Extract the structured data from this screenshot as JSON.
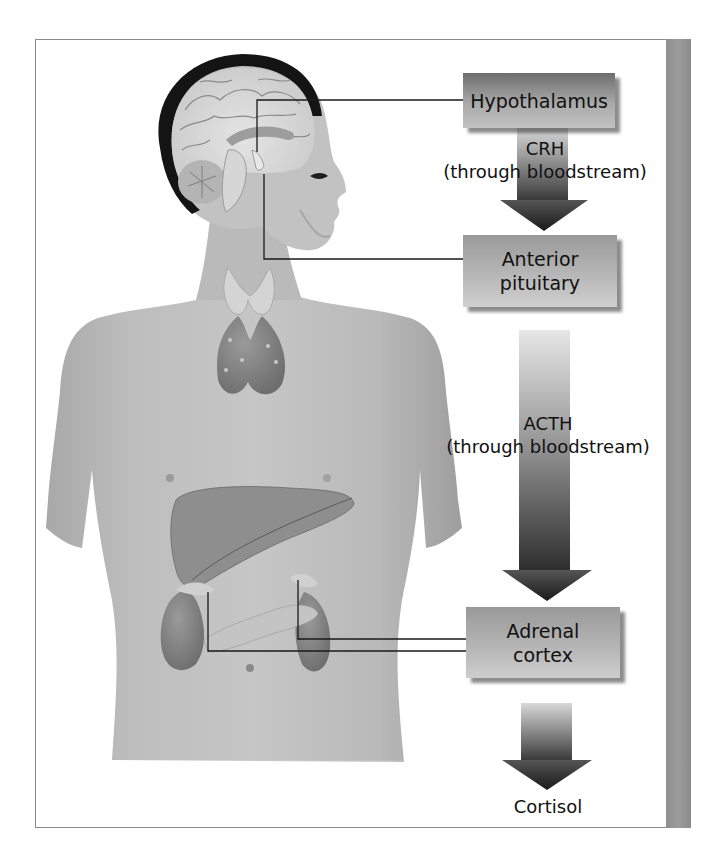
{
  "diagram": {
    "boxes": {
      "hypothalamus": "Hypothalamus",
      "anterior_pituitary_line1": "Anterior",
      "anterior_pituitary_line2": "pituitary",
      "adrenal_cortex_line1": "Adrenal",
      "adrenal_cortex_line2": "cortex"
    },
    "arrows": {
      "crh_line1": "CRH",
      "crh_line2": "(through bloodstream)",
      "acth_line1": "ACTH",
      "acth_line2": "(through bloodstream)"
    },
    "output": "Cortisol",
    "illustration": {
      "description": "Human figure with sagittal brain section, thyroid, liver, pancreas and kidneys with adrenal glands",
      "structures": [
        "brain",
        "hypothalamus",
        "pituitary",
        "thyroid",
        "liver",
        "pancreas",
        "kidneys",
        "adrenal glands"
      ]
    },
    "colors": {
      "box_dark": "#6d6d6d",
      "box_light": "#c8c8c8",
      "arrow_dark": "#2a2a2a",
      "side_bar": "#929292",
      "skin": "#bdbdbd",
      "frame": "#8a8a8a"
    }
  }
}
